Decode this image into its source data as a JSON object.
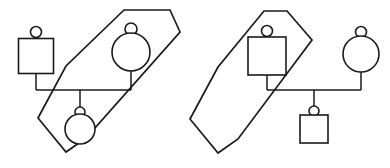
{
  "diagram": {
    "title": "Pedigree diagram with two diagonal hexagon groupings",
    "type": "pedigree-chart",
    "canvas": {
      "width": 390,
      "height": 168,
      "background": "#ffffff"
    },
    "style": {
      "line_color": "#1a1a1a",
      "fill_color": "#ffffff",
      "shape_stroke_width": 1.6,
      "hexagon_stroke_width": 1.7,
      "connector_stroke_width": 1.5
    },
    "icon_names": {
      "square": "square-symbol-icon",
      "circle": "circle-symbol-icon",
      "knob": "small-circle-knob-icon",
      "hexagon": "hexagon-grouping-icon",
      "mating_line": "mating-line",
      "sibship_line": "sibship-line",
      "descent_line": "descent-line"
    },
    "groups": [
      {
        "id": "group-left",
        "label": "Left grouping",
        "hexagon": {
          "name": "hexagon-left",
          "points": "124,10 170,10 180,32 86,138 66,152 38,118 66,66 124,10",
          "orientation": "diagonal-lower-left-to-upper-right"
        },
        "members": [
          {
            "id": "left-parent-square",
            "shape": "square",
            "label": "Square parent, outside hexagon",
            "inside_hexagon": false,
            "cx": 36,
            "cy": 56,
            "size": 35,
            "knob": {
              "cx": 36,
              "cy": 32,
              "r": 5.5
            },
            "stem": {
              "x": 36,
              "y1": 73.5,
              "y2": 90
            }
          },
          {
            "id": "left-parent-circle",
            "shape": "circle",
            "label": "Circle parent, inside hexagon",
            "inside_hexagon": true,
            "cx": 131,
            "cy": 52,
            "r": 19,
            "knob": {
              "cx": 131,
              "cy": 29,
              "r": 6
            },
            "stem": {
              "x": 131,
              "y1": 71,
              "y2": 90
            }
          },
          {
            "id": "left-child-circle",
            "shape": "circle",
            "label": "Circle child, inside hexagon",
            "inside_hexagon": true,
            "cx": 80,
            "cy": 129,
            "r": 15,
            "knob": {
              "cx": 80,
              "cy": 112,
              "r": 5
            },
            "stem": {
              "x": 80,
              "y1": 90,
              "y2": 107
            }
          }
        ],
        "connectors": [
          {
            "name": "sibship-line-left",
            "d": "M36,90 L131,90"
          },
          {
            "name": "descent-line-left",
            "d": "M80,90 L80,107"
          }
        ]
      },
      {
        "id": "group-right",
        "label": "Right grouping",
        "hexagon": {
          "name": "hexagon-right",
          "points": "287,11 312,40 238,139 218,153 190,119 218,67 264,11 287,11",
          "orientation": "diagonal-lower-left-to-upper-right"
        },
        "members": [
          {
            "id": "right-parent-square",
            "shape": "square",
            "label": "Square parent, inside hexagon",
            "inside_hexagon": true,
            "cx": 267,
            "cy": 56,
            "size": 38,
            "knob": {
              "cx": 267,
              "cy": 31,
              "r": 5.5
            },
            "stem": {
              "x": 267,
              "y1": 75,
              "y2": 90
            }
          },
          {
            "id": "right-parent-circle",
            "shape": "circle",
            "label": "Circle parent, outside hexagon",
            "inside_hexagon": false,
            "cx": 361,
            "cy": 54,
            "r": 18,
            "knob": {
              "cx": 361,
              "cy": 32,
              "r": 5.5
            },
            "stem": {
              "x": 361,
              "y1": 72,
              "y2": 90
            }
          },
          {
            "id": "right-child-square",
            "shape": "square",
            "label": "Square child, inside hexagon",
            "inside_hexagon": true,
            "cx": 314,
            "cy": 129,
            "size": 28,
            "knob": {
              "cx": 314,
              "cy": 111,
              "r": 5
            },
            "stem": {
              "x": 314,
              "y1": 90,
              "y2": 115
            }
          }
        ],
        "connectors": [
          {
            "name": "sibship-line-right",
            "d": "M267,90 L361,90"
          },
          {
            "name": "descent-line-right",
            "d": "M314,90 L314,115"
          }
        ]
      }
    ]
  }
}
